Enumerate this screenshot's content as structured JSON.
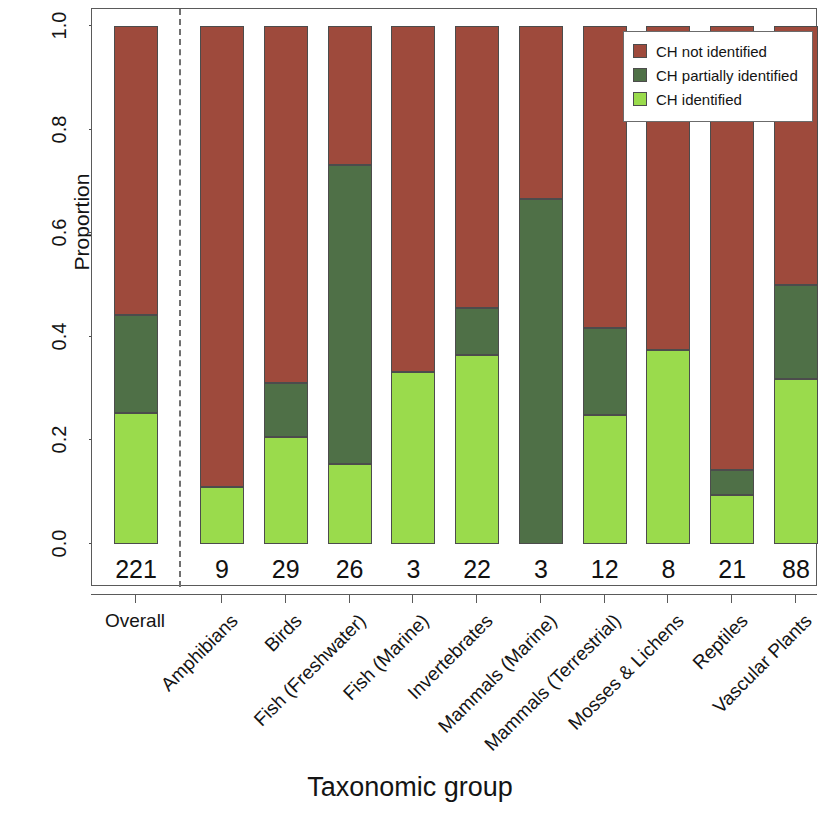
{
  "chart_data": {
    "type": "bar",
    "subtype": "stacked-proportional",
    "title": "",
    "xlabel": "Taxonomic group",
    "ylabel": "Proportion",
    "ylim": [
      0.0,
      1.0
    ],
    "ytick_labels": [
      "0.0",
      "0.2",
      "0.4",
      "0.6",
      "0.8",
      "1.0"
    ],
    "ytick_values": [
      0.0,
      0.2,
      0.4,
      0.6,
      0.8,
      1.0
    ],
    "grid": false,
    "legend_position": "top-right",
    "categories": [
      "Overall",
      "Amphibians",
      "Birds",
      "Fish (Freshwater)",
      "Fish (Marine)",
      "Invertebrates",
      "Mammals (Marine)",
      "Mammals (Terrestrial)",
      "Mosses & Lichens",
      "Reptiles",
      "Vascular Plants"
    ],
    "counts": [
      221,
      9,
      29,
      26,
      3,
      22,
      3,
      12,
      8,
      21,
      88
    ],
    "series": [
      {
        "name": "CH identified",
        "color": "#9adb4c",
        "values": [
          0.253,
          0.111,
          0.207,
          0.155,
          0.333,
          0.364,
          0.0,
          0.25,
          0.375,
          0.095,
          0.318
        ]
      },
      {
        "name": "CH partially identified",
        "color": "#4f7047",
        "values": [
          0.19,
          0.0,
          0.104,
          0.576,
          0.0,
          0.091,
          0.667,
          0.167,
          0.0,
          0.048,
          0.182
        ]
      },
      {
        "name": "CH not identified",
        "color": "#9e4a3c",
        "values": [
          0.557,
          0.889,
          0.689,
          0.269,
          0.667,
          0.545,
          0.333,
          0.583,
          0.625,
          0.857,
          0.5
        ]
      }
    ],
    "separator_after_category": "Overall"
  },
  "legend": {
    "items": [
      {
        "label": "CH not identified",
        "color": "#9e4a3c"
      },
      {
        "label": "CH partially identified",
        "color": "#4f7047"
      },
      {
        "label": "CH identified",
        "color": "#9adb4c"
      }
    ]
  }
}
